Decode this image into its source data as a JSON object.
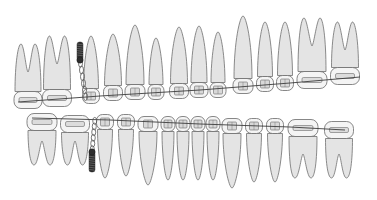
{
  "figure": {
    "background": "#ffffff",
    "colors": {
      "root_fill": "#e4e4e4",
      "crown_fill": "#f4f4f4",
      "outline": "#6a6a6a",
      "wire": "#3c3c3c",
      "screw": "#2e2e2e"
    },
    "upper_arch": {
      "teeth": [
        {
          "type": "molar",
          "x": 28,
          "w": 26,
          "crown_y": 100,
          "root_top": 44,
          "attachment": "tube"
        },
        {
          "type": "molar",
          "x": 57,
          "w": 27,
          "crown_y": 98,
          "root_top": 36,
          "attachment": "tube"
        },
        {
          "type": "premolar",
          "x": 91,
          "w": 15,
          "crown_y": 96,
          "root_top": 36,
          "attachment": "bracket"
        },
        {
          "type": "premolar",
          "x": 113,
          "w": 17,
          "crown_y": 93,
          "root_top": 34,
          "attachment": "bracket"
        },
        {
          "type": "canine",
          "x": 135,
          "w": 18,
          "crown_y": 92,
          "root_top": 25,
          "attachment": "bracket"
        },
        {
          "type": "lateral",
          "x": 156,
          "w": 14,
          "crown_y": 92,
          "root_top": 38,
          "attachment": "bracket"
        },
        {
          "type": "central",
          "x": 179,
          "w": 17,
          "crown_y": 91,
          "root_top": 27,
          "attachment": "bracket"
        },
        {
          "type": "central",
          "x": 199,
          "w": 16,
          "crown_y": 90,
          "root_top": 26,
          "attachment": "bracket"
        },
        {
          "type": "lateral",
          "x": 218,
          "w": 14,
          "crown_y": 90,
          "root_top": 32,
          "attachment": "bracket"
        },
        {
          "type": "canine",
          "x": 243,
          "w": 18,
          "crown_y": 86,
          "root_top": 16,
          "attachment": "bracket"
        },
        {
          "type": "premolar",
          "x": 265,
          "w": 15,
          "crown_y": 84,
          "root_top": 22,
          "attachment": "bracket"
        },
        {
          "type": "premolar",
          "x": 285,
          "w": 15,
          "crown_y": 83,
          "root_top": 22,
          "attachment": "bracket"
        },
        {
          "type": "molar",
          "x": 312,
          "w": 28,
          "crown_y": 80,
          "root_top": 18,
          "attachment": "tube"
        },
        {
          "type": "molar",
          "x": 345,
          "w": 27,
          "crown_y": 76,
          "root_top": 22,
          "attachment": "tube"
        }
      ]
    },
    "lower_arch": {
      "teeth": [
        {
          "type": "molar",
          "x": 42,
          "w": 28,
          "crown_y": 122,
          "root_bottom": 165,
          "attachment": "tube"
        },
        {
          "type": "molar",
          "x": 75,
          "w": 27,
          "crown_y": 124,
          "root_bottom": 165,
          "attachment": "tube"
        },
        {
          "type": "premolar",
          "x": 105,
          "w": 15,
          "crown_y": 122,
          "root_bottom": 178,
          "attachment": "bracket"
        },
        {
          "type": "premolar",
          "x": 126,
          "w": 15,
          "crown_y": 122,
          "root_bottom": 176,
          "attachment": "bracket"
        },
        {
          "type": "canine",
          "x": 148,
          "w": 18,
          "crown_y": 124,
          "root_bottom": 185,
          "attachment": "bracket"
        },
        {
          "type": "incisor",
          "x": 168,
          "w": 12,
          "crown_y": 124,
          "root_bottom": 180,
          "attachment": "bracket"
        },
        {
          "type": "incisor",
          "x": 183,
          "w": 12,
          "crown_y": 124,
          "root_bottom": 180,
          "attachment": "bracket"
        },
        {
          "type": "incisor",
          "x": 198,
          "w": 12,
          "crown_y": 124,
          "root_bottom": 180,
          "attachment": "bracket"
        },
        {
          "type": "incisor",
          "x": 213,
          "w": 12,
          "crown_y": 124,
          "root_bottom": 180,
          "attachment": "bracket"
        },
        {
          "type": "canine",
          "x": 232,
          "w": 18,
          "crown_y": 126,
          "root_bottom": 188,
          "attachment": "bracket"
        },
        {
          "type": "premolar",
          "x": 254,
          "w": 15,
          "crown_y": 126,
          "root_bottom": 182,
          "attachment": "bracket"
        },
        {
          "type": "premolar",
          "x": 275,
          "w": 15,
          "crown_y": 126,
          "root_bottom": 182,
          "attachment": "bracket"
        },
        {
          "type": "molar",
          "x": 303,
          "w": 28,
          "crown_y": 128,
          "root_bottom": 178,
          "attachment": "tube"
        },
        {
          "type": "molar",
          "x": 339,
          "w": 27,
          "crown_y": 130,
          "root_bottom": 178,
          "attachment": "tube"
        }
      ]
    },
    "archwires": {
      "upper": [
        [
          18,
          102
        ],
        [
          100,
          96
        ],
        [
          200,
          90
        ],
        [
          290,
          83
        ],
        [
          360,
          77
        ]
      ],
      "lower": [
        [
          32,
          118
        ],
        [
          110,
          120
        ],
        [
          200,
          124
        ],
        [
          290,
          127
        ],
        [
          345,
          130
        ]
      ]
    },
    "miniscrews": [
      {
        "position": "upper",
        "x": 80,
        "y_head": 60,
        "y_tip": 42,
        "chain_to": [
          86,
          100
        ]
      },
      {
        "position": "lower",
        "x": 92,
        "y_head": 152,
        "y_tip": 172,
        "chain_to": [
          95,
          118
        ]
      }
    ]
  }
}
